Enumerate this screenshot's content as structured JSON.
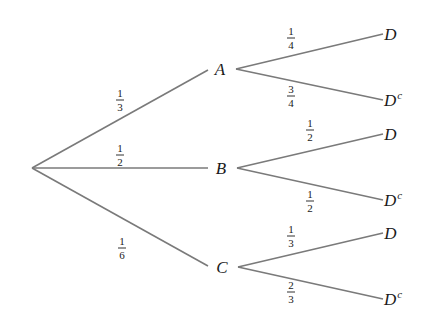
{
  "diagram": {
    "type": "probability-tree",
    "line_color": "#7a7a7a",
    "text_color": "#1a1a1a",
    "root": {
      "x": 32,
      "y": 168
    },
    "first_level": [
      {
        "id": "A",
        "label": "A",
        "x": 220,
        "y": 69,
        "edge_start": {
          "x": 32,
          "y": 168
        },
        "edge_end": {
          "x": 208,
          "y": 70
        },
        "prob": {
          "num": "1",
          "den": "3",
          "x": 120,
          "y": 100
        },
        "children": [
          {
            "label": "D",
            "sup": "",
            "x": 391,
            "y": 34,
            "edge_start": {
              "x": 236,
              "y": 69
            },
            "edge_end": {
              "x": 383,
              "y": 34
            },
            "prob": {
              "num": "1",
              "den": "4",
              "x": 291,
              "y": 38
            }
          },
          {
            "label": "D",
            "sup": "c",
            "x": 393,
            "y": 100,
            "edge_start": {
              "x": 236,
              "y": 69
            },
            "edge_end": {
              "x": 383,
              "y": 100
            },
            "prob": {
              "num": "3",
              "den": "4",
              "x": 291,
              "y": 96
            }
          }
        ]
      },
      {
        "id": "B",
        "label": "B",
        "x": 221,
        "y": 168,
        "edge_start": {
          "x": 32,
          "y": 168
        },
        "edge_end": {
          "x": 208,
          "y": 168
        },
        "prob": {
          "num": "1",
          "den": "2",
          "x": 120,
          "y": 155
        },
        "children": [
          {
            "label": "D",
            "sup": "",
            "x": 391,
            "y": 134,
            "edge_start": {
              "x": 237,
              "y": 168
            },
            "edge_end": {
              "x": 383,
              "y": 134
            },
            "prob": {
              "num": "1",
              "den": "2",
              "x": 310,
              "y": 130
            }
          },
          {
            "label": "D",
            "sup": "c",
            "x": 393,
            "y": 200,
            "edge_start": {
              "x": 237,
              "y": 168
            },
            "edge_end": {
              "x": 383,
              "y": 200
            },
            "prob": {
              "num": "1",
              "den": "2",
              "x": 310,
              "y": 201
            }
          }
        ]
      },
      {
        "id": "C",
        "label": "C",
        "x": 222,
        "y": 267,
        "edge_start": {
          "x": 32,
          "y": 168
        },
        "edge_end": {
          "x": 208,
          "y": 266
        },
        "prob": {
          "num": "1",
          "den": "6",
          "x": 122,
          "y": 248
        },
        "children": [
          {
            "label": "D",
            "sup": "",
            "x": 391,
            "y": 233,
            "edge_start": {
              "x": 238,
              "y": 267
            },
            "edge_end": {
              "x": 383,
              "y": 233
            },
            "prob": {
              "num": "1",
              "den": "3",
              "x": 291,
              "y": 236
            }
          },
          {
            "label": "D",
            "sup": "c",
            "x": 393,
            "y": 299,
            "edge_start": {
              "x": 238,
              "y": 267
            },
            "edge_end": {
              "x": 383,
              "y": 299
            },
            "prob": {
              "num": "2",
              "den": "3",
              "x": 291,
              "y": 292
            }
          }
        ]
      }
    ]
  }
}
